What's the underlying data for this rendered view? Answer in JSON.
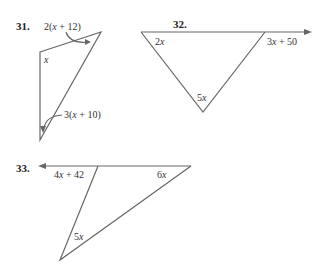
{
  "problems": [
    {
      "number": "31.",
      "angles": [
        {
          "label_pre": "2(",
          "var": "x",
          "label_post": " + 12)",
          "position": "top-right exterior arrow"
        },
        {
          "label_pre": "",
          "var": "x",
          "label_post": "",
          "position": "top-left interior"
        },
        {
          "label_pre": "3(",
          "var": "x",
          "label_post": " + 10)",
          "position": "bottom exterior arrow"
        }
      ]
    },
    {
      "number": "32.",
      "angles": [
        {
          "label_pre": "2",
          "var": "x",
          "label_post": "",
          "position": "top-left interior"
        },
        {
          "label_pre": "3",
          "var": "x",
          "label_post": " + 50",
          "position": "top-right exterior"
        },
        {
          "label_pre": "5",
          "var": "x",
          "label_post": "",
          "position": "bottom interior"
        }
      ]
    },
    {
      "number": "33.",
      "angles": [
        {
          "label_pre": "4",
          "var": "x",
          "label_post": " + 42",
          "position": "top-left exterior"
        },
        {
          "label_pre": "6",
          "var": "x",
          "label_post": "",
          "position": "top-right interior"
        },
        {
          "label_pre": "5",
          "var": "x",
          "label_post": "",
          "position": "bottom interior"
        }
      ]
    }
  ],
  "colors": {
    "line": "#666666",
    "text": "#333333"
  }
}
